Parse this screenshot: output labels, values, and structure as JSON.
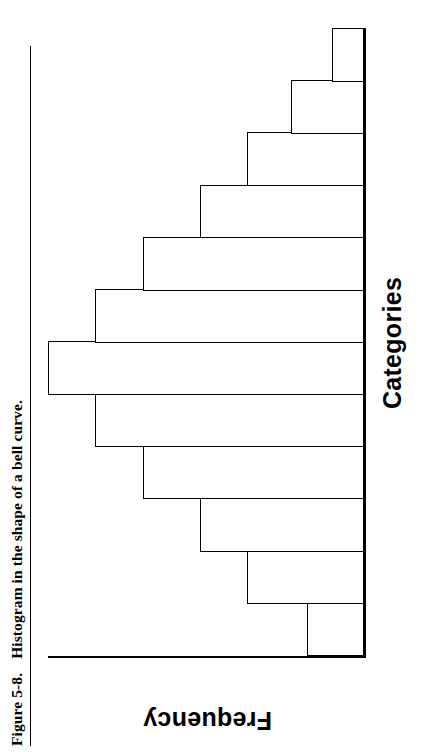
{
  "caption": {
    "figure_number": "Figure 5-8.",
    "text": "Histogram in the shape of a bell curve."
  },
  "chart_data": {
    "type": "bar",
    "title": "",
    "subtitle": "",
    "xlabel": "Categories",
    "ylabel": "Frequency",
    "categories": [
      "1",
      "2",
      "3",
      "4",
      "5",
      "6",
      "7",
      "8",
      "9",
      "10",
      "11",
      "12"
    ],
    "values": [
      18,
      37,
      52,
      70,
      85,
      100,
      85,
      70,
      52,
      37,
      23,
      10
    ],
    "ylim": [
      0,
      100
    ],
    "grid": false,
    "legend": null,
    "bar_fill_color": "#ffffff",
    "bar_border_color": "#000000",
    "axis_color": "#000000"
  }
}
